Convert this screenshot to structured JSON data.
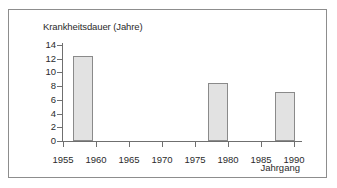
{
  "chart_data": {
    "type": "bar",
    "title": "Krankheitsdauer (Jahre)",
    "xlabel": "Jahrgang",
    "ylabel": "Krankheitsdauer (Jahre)",
    "x": [
      1958,
      1978.5,
      1988.5
    ],
    "values": [
      12.4,
      8.4,
      7.1
    ],
    "bar_spans": [
      {
        "start": 1956.5,
        "end": 1959.5,
        "value": 12.4
      },
      {
        "start": 1977.0,
        "end": 1980.0,
        "value": 8.4
      },
      {
        "start": 1987.0,
        "end": 1990.0,
        "value": 7.1
      }
    ],
    "xlim": [
      1955,
      1991
    ],
    "ylim": [
      0,
      14
    ],
    "xticks": [
      1955,
      1960,
      1965,
      1970,
      1975,
      1980,
      1985,
      1990
    ],
    "xticklabels": [
      "1955",
      "1960",
      "1965",
      "1970",
      "1975",
      "1980",
      "1985",
      "1990"
    ],
    "yticks": [
      0,
      2,
      4,
      6,
      8,
      10,
      12,
      14
    ],
    "yticklabels": [
      "0",
      "2",
      "4",
      "6",
      "8",
      "10",
      "12",
      "14"
    ],
    "grid": false,
    "legend": null,
    "bar_fill_color": "#e2e2e2",
    "bar_edge_color": "#8a8a8a",
    "axis_color": "#6f6f6f",
    "text_color": "#2b2b2b",
    "frame_color": "#8d8d8d",
    "background_color": "#ffffff"
  }
}
